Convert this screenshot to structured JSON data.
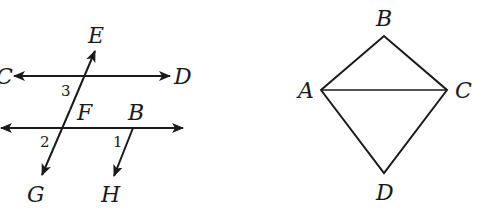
{
  "figure_left": {
    "description": "Two horizontal lines cut by transversal EG, with ray BH",
    "points": {
      "C": "C",
      "D": "D",
      "E": "E",
      "F": "F",
      "G": "G",
      "B": "B",
      "H": "H"
    },
    "angles": {
      "a1": "1",
      "a2": "2",
      "a3": "3"
    }
  },
  "figure_right": {
    "description": "Quadrilateral ABCD with diagonal AC",
    "points": {
      "A": "A",
      "B": "B",
      "C": "C",
      "D": "D"
    }
  }
}
